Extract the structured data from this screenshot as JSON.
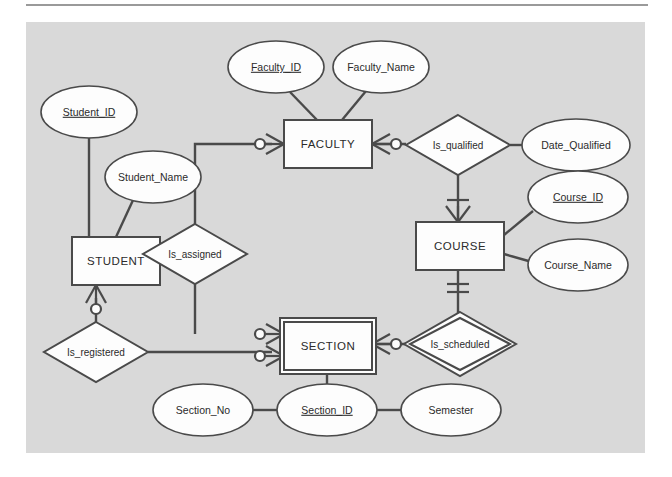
{
  "diagram": {
    "notation": "crow's foot",
    "canvas_color": "#d9d9d9",
    "shape_fill": "#fdfdfd",
    "line_color": "#4a4a4a",
    "text_color": "#2b2b2b"
  },
  "entities": [
    {
      "id": "student",
      "label": "STUDENT",
      "weak": false,
      "x": 46,
      "y": 215,
      "w": 88,
      "h": 48
    },
    {
      "id": "faculty",
      "label": "FACULTY",
      "weak": false,
      "x": 258,
      "y": 98,
      "w": 88,
      "h": 48
    },
    {
      "id": "course",
      "label": "COURSE",
      "weak": false,
      "x": 390,
      "y": 200,
      "w": 88,
      "h": 48
    },
    {
      "id": "section",
      "label": "SECTION",
      "weak": true,
      "x": 258,
      "y": 300,
      "w": 88,
      "h": 48
    }
  ],
  "relationships": [
    {
      "id": "is_assigned",
      "label": "Is_assigned",
      "identifying": false,
      "cx": 169,
      "cy": 232,
      "rx": 52,
      "ry": 30
    },
    {
      "id": "is_registered",
      "label": "Is_registered",
      "identifying": false,
      "cx": 70,
      "cy": 330,
      "rx": 52,
      "ry": 30
    },
    {
      "id": "is_qualified",
      "label": "Is_qualified",
      "identifying": false,
      "cx": 432,
      "cy": 123,
      "rx": 52,
      "ry": 30
    },
    {
      "id": "is_scheduled",
      "label": "Is_scheduled",
      "identifying": true,
      "cx": 434,
      "cy": 322,
      "rx": 50,
      "ry": 26
    }
  ],
  "attributes": [
    {
      "id": "student_id",
      "label": "Student_ID",
      "primary_key": true,
      "cx": 63,
      "cy": 90,
      "rx": 48,
      "ry": 26
    },
    {
      "id": "student_name",
      "label": "Student_Name",
      "primary_key": false,
      "cx": 127,
      "cy": 155,
      "rx": 48,
      "ry": 26
    },
    {
      "id": "faculty_id",
      "label": "Faculty_ID",
      "primary_key": true,
      "cx": 250,
      "cy": 45,
      "rx": 48,
      "ry": 26
    },
    {
      "id": "faculty_name",
      "label": "Faculty_Name",
      "primary_key": false,
      "cx": 355,
      "cy": 45,
      "rx": 48,
      "ry": 26
    },
    {
      "id": "date_qualified",
      "label": "Date_Qualified",
      "primary_key": false,
      "cx": 550,
      "cy": 123,
      "rx": 54,
      "ry": 26
    },
    {
      "id": "course_id",
      "label": "Course_ID",
      "primary_key": true,
      "cx": 552,
      "cy": 175,
      "rx": 50,
      "ry": 26
    },
    {
      "id": "course_name",
      "label": "Course_Name",
      "primary_key": false,
      "cx": 552,
      "cy": 243,
      "rx": 50,
      "ry": 26
    },
    {
      "id": "section_no",
      "label": "Section_No",
      "primary_key": false,
      "cx": 177,
      "cy": 388,
      "rx": 50,
      "ry": 26
    },
    {
      "id": "section_id",
      "label": "Section_ID",
      "primary_key": true,
      "cx": 301,
      "cy": 388,
      "rx": 50,
      "ry": 26
    },
    {
      "id": "semester",
      "label": "Semester",
      "primary_key": false,
      "cx": 425,
      "cy": 388,
      "rx": 50,
      "ry": 26
    }
  ],
  "cardinalities": [
    {
      "id": "faculty-is_assigned",
      "notation": "zero-or-many",
      "at": "faculty-left"
    },
    {
      "id": "faculty-is_qualified",
      "notation": "zero-or-many",
      "at": "faculty-right"
    },
    {
      "id": "student-is_registered",
      "notation": "zero-or-many",
      "at": "student-bottom"
    },
    {
      "id": "section-is_assigned",
      "notation": "zero-or-many",
      "at": "section-left-top"
    },
    {
      "id": "section-is_registered",
      "notation": "zero-or-many",
      "at": "section-left-bottom"
    },
    {
      "id": "section-is_scheduled",
      "notation": "zero-or-many",
      "at": "section-right"
    },
    {
      "id": "course-is_qualified",
      "notation": "one-or-many",
      "at": "course-top"
    },
    {
      "id": "course-is_scheduled",
      "notation": "one-and-only-one",
      "at": "course-bottom"
    }
  ]
}
